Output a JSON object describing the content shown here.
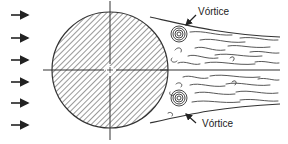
{
  "diagram": {
    "labels": {
      "vortex_top": "Vórtice",
      "vortex_bottom": "Vórtice"
    },
    "colors": {
      "stroke": "#2a2a2a",
      "background": "#ffffff"
    },
    "elements": {
      "inflow_arrows": 6,
      "cylinder": "hatched circle with center crosshair",
      "wake": "turbulent wake bounded by two separation streamlines",
      "vortices": 2
    }
  }
}
